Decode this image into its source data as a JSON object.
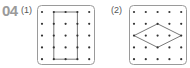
{
  "problem": {
    "number": "04",
    "parts": [
      {
        "label": "(1)",
        "grid": {
          "rows": 5,
          "cols": 5
        },
        "shape": "rectangle",
        "vertices": [
          [
            2,
            1
          ],
          [
            4,
            1
          ],
          [
            4,
            5
          ],
          [
            2,
            5
          ]
        ]
      },
      {
        "label": "(2)",
        "grid": {
          "rows": 5,
          "cols": 5
        },
        "shape": "rhombus",
        "vertices": [
          [
            1,
            3
          ],
          [
            3,
            2
          ],
          [
            5,
            3
          ],
          [
            3,
            4
          ]
        ]
      }
    ]
  },
  "colors": {
    "border": "#9a9a9a",
    "dot": "#333333",
    "line": "#555555",
    "number": "#9a9a9a"
  }
}
